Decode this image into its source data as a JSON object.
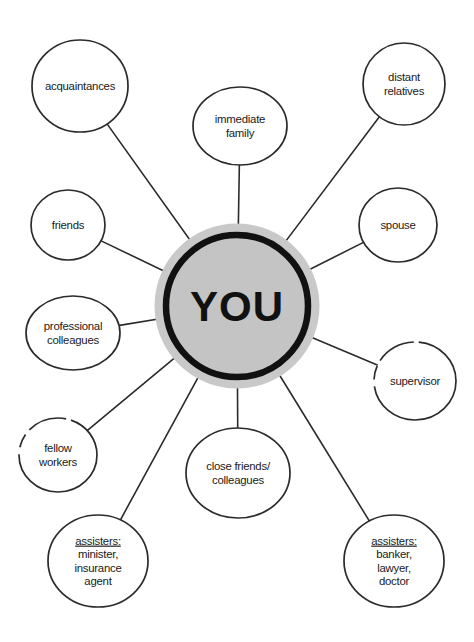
{
  "diagram": {
    "type": "radial hub-and-spoke",
    "colors": {
      "background": "#ffffff",
      "line": "#2b2b2b",
      "node_fill": "#ffffff",
      "node_stroke": "#2b2b2b",
      "center_fill": "#c4c4c4",
      "center_stroke": "#111111",
      "center_halo": "#c9c9c9",
      "text": "#1a1a1a"
    },
    "center": {
      "label": "YOU",
      "cx": 237,
      "cy": 306,
      "r": 71,
      "halo_r": 78
    },
    "nodes": [
      {
        "id": "acquaintances",
        "lines": [
          "acquaintances"
        ],
        "cx": 80,
        "cy": 86,
        "rx": 48,
        "ry": 46,
        "broken": false,
        "underline_first": false
      },
      {
        "id": "immediate-family",
        "lines": [
          "immediate",
          "family"
        ],
        "cx": 240,
        "cy": 126,
        "rx": 47,
        "ry": 39,
        "broken": false,
        "underline_first": false
      },
      {
        "id": "distant-relatives",
        "lines": [
          "distant",
          "relatives"
        ],
        "cx": 404,
        "cy": 84,
        "rx": 41,
        "ry": 41,
        "broken": false,
        "underline_first": false
      },
      {
        "id": "friends",
        "lines": [
          "friends"
        ],
        "cx": 68,
        "cy": 225,
        "rx": 37,
        "ry": 35,
        "broken": false,
        "underline_first": false
      },
      {
        "id": "spouse",
        "lines": [
          "spouse"
        ],
        "cx": 398,
        "cy": 225,
        "rx": 39,
        "ry": 37,
        "broken": false,
        "underline_first": false
      },
      {
        "id": "professional-colleagues",
        "lines": [
          "professional",
          "colleagues"
        ],
        "cx": 73,
        "cy": 333,
        "rx": 47,
        "ry": 37,
        "broken": false,
        "underline_first": false
      },
      {
        "id": "supervisor",
        "lines": [
          "supervisor"
        ],
        "cx": 415,
        "cy": 381,
        "rx": 41,
        "ry": 39,
        "broken": true,
        "underline_first": false
      },
      {
        "id": "fellow-workers",
        "lines": [
          "fellow",
          "workers"
        ],
        "cx": 58,
        "cy": 455,
        "rx": 39,
        "ry": 37,
        "broken": true,
        "underline_first": false
      },
      {
        "id": "close-friends-colleagues",
        "lines": [
          "close friends/",
          "colleagues"
        ],
        "cx": 238,
        "cy": 473,
        "rx": 52,
        "ry": 45,
        "broken": false,
        "underline_first": false
      },
      {
        "id": "assisters-minister",
        "lines": [
          "assisters:",
          "minister,",
          "insurance",
          "agent"
        ],
        "cx": 98,
        "cy": 561,
        "rx": 50,
        "ry": 46,
        "broken": false,
        "underline_first": true
      },
      {
        "id": "assisters-banker",
        "lines": [
          "assisters:",
          "banker,",
          "lawyer,",
          "doctor"
        ],
        "cx": 394,
        "cy": 561,
        "rx": 50,
        "ry": 46,
        "broken": false,
        "underline_first": true
      }
    ],
    "connections": [
      {
        "from": "center",
        "to": "acquaintances"
      },
      {
        "from": "center",
        "to": "immediate-family"
      },
      {
        "from": "center",
        "to": "distant-relatives"
      },
      {
        "from": "center",
        "to": "friends"
      },
      {
        "from": "center",
        "to": "spouse"
      },
      {
        "from": "center",
        "to": "professional-colleagues"
      },
      {
        "from": "center",
        "to": "supervisor"
      },
      {
        "from": "center",
        "to": "fellow-workers"
      },
      {
        "from": "center",
        "to": "close-friends-colleagues"
      },
      {
        "from": "center",
        "to": "assisters-minister"
      },
      {
        "from": "center",
        "to": "assisters-banker"
      }
    ]
  }
}
